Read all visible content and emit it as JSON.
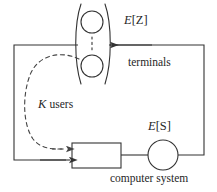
{
  "diagram": {
    "kind": "closed-queueing-network",
    "background_color": "#ffffff",
    "stroke_color": "#333333",
    "labels": {
      "terminal_think_time": "E[Z]",
      "terminal_think_time_symbol": "E",
      "terminal_think_time_arg": "[Z]",
      "terminals": "terminals",
      "users_count": "K",
      "users_word": "users",
      "service_time": "E[S]",
      "service_time_symbol": "E",
      "service_time_arg": "[S]",
      "computer_system": "computer system"
    },
    "nodes": [
      {
        "name": "terminal-upper",
        "type": "circle",
        "cx": 92,
        "cy": 22,
        "r": 11
      },
      {
        "name": "terminal-lower",
        "type": "circle",
        "cx": 92,
        "cy": 66,
        "r": 11
      },
      {
        "name": "queue-box",
        "type": "rect",
        "x": 72,
        "y": 143,
        "w": 49,
        "h": 25
      },
      {
        "name": "server-circle",
        "type": "circle",
        "cx": 163,
        "cy": 155,
        "r": 15
      }
    ],
    "edges": [
      {
        "name": "feedback-top",
        "from": "server-right",
        "to": "terminals-right",
        "style": "solid",
        "arrow": "left"
      },
      {
        "name": "queue-to-server",
        "from": "queue-box",
        "to": "server-circle",
        "style": "solid",
        "arrow": "none"
      },
      {
        "name": "outer-left-loop",
        "from": "terminals-left",
        "to": "queue-box",
        "style": "solid",
        "arrow": "right"
      },
      {
        "name": "users-flow",
        "from": "terminals",
        "to": "queue-box",
        "style": "dashed",
        "arrow": "right"
      },
      {
        "name": "terminal-stack-dashes",
        "from": "terminal-upper",
        "to": "terminal-lower",
        "style": "dashed",
        "arrow": "none"
      }
    ]
  }
}
